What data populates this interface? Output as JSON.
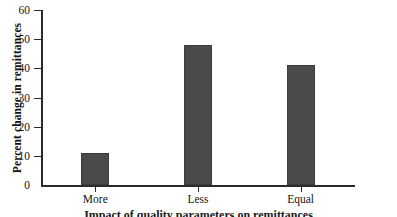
{
  "chart_data": {
    "type": "bar",
    "title": "",
    "xlabel": "",
    "ylabel": "Percent change in remittances",
    "categories": [
      "More",
      "Less",
      "Equal"
    ],
    "values": [
      11,
      48,
      41
    ],
    "ylim": [
      0,
      60
    ],
    "yticks": [
      0,
      10,
      20,
      30,
      40,
      50,
      60
    ],
    "ytick_labels": [
      "0",
      "10",
      "20",
      "30",
      "40",
      "50",
      "60"
    ],
    "grid": false,
    "legend": null,
    "bar_color": "#4a4a4a",
    "axis_color": "#2b2b2b"
  },
  "figure": {
    "caption_clipped": "Impact of quality parameters on remittances"
  }
}
